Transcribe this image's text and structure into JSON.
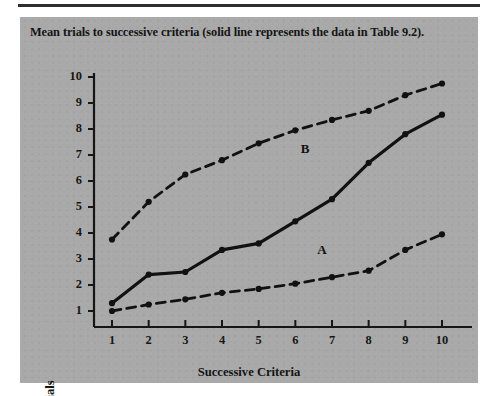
{
  "figure": {
    "caption": "Mean trials to successive criteria (solid line represents the data in Table 9.2).",
    "background_color": "#a9a9a9",
    "rule_color": "#2e2e2e"
  },
  "chart_data": {
    "type": "line",
    "title": "Mean trials to successive criteria (solid line represents the data in Table 9.2).",
    "xlabel": "Successive Criteria",
    "ylabel": "Trials",
    "x": [
      1,
      2,
      3,
      4,
      5,
      6,
      7,
      8,
      9,
      10
    ],
    "xlim": [
      0.6,
      10.4
    ],
    "ylim": [
      0.4,
      10.4
    ],
    "xticks": [
      1,
      2,
      3,
      4,
      5,
      6,
      7,
      8,
      9,
      10
    ],
    "yticks": [
      1,
      2,
      3,
      4,
      5,
      6,
      7,
      8,
      9,
      10
    ],
    "xtick_labels": [
      "1",
      "2",
      "3",
      "4",
      "5",
      "6",
      "7",
      "8",
      "9",
      "10"
    ],
    "ytick_labels": [
      "1",
      "2",
      "3",
      "4",
      "5",
      "6",
      "7",
      "8",
      "9",
      "10"
    ],
    "grid": false,
    "legend_position": "inline-annotations",
    "series": [
      {
        "name": "Table 9.2 data",
        "style": "solid",
        "color": "#111111",
        "marker": "circle",
        "values": [
          1.3,
          2.4,
          2.5,
          3.35,
          3.6,
          4.45,
          5.3,
          6.7,
          7.8,
          8.55
        ]
      },
      {
        "name": "B",
        "style": "dashed",
        "color": "#111111",
        "marker": "circle",
        "annotation": "B",
        "values": [
          3.75,
          5.2,
          6.25,
          6.8,
          7.45,
          7.95,
          8.35,
          8.7,
          9.3,
          9.75
        ]
      },
      {
        "name": "A",
        "style": "dashed",
        "color": "#111111",
        "marker": "circle",
        "annotation": "A",
        "values": [
          1.0,
          1.25,
          1.45,
          1.7,
          1.85,
          2.05,
          2.3,
          2.55,
          3.35,
          3.95
        ]
      }
    ],
    "annotations": [
      {
        "text": "B",
        "x": 6.15,
        "y": 7.2
      },
      {
        "text": "A",
        "x": 6.6,
        "y": 3.3
      }
    ]
  }
}
